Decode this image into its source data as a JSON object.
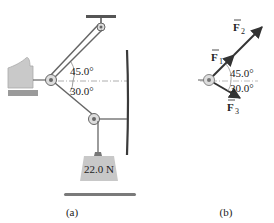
{
  "figure_a": {
    "caption": "(a)",
    "angle_upper": "45.0°",
    "angle_lower": "30.0°",
    "weight_label": "22.0 N"
  },
  "figure_b": {
    "caption": "(b)",
    "angle_upper": "45.0°",
    "angle_lower": "30.0°",
    "force_1": "F",
    "force_1_sub": "1",
    "force_2": "F",
    "force_2_sub": "2",
    "force_3": "F",
    "force_3_sub": "3"
  },
  "colors": {
    "hand": "#c9c9c9",
    "weight": "#c8c8c8",
    "wall": "#3a3a3a",
    "cable": "#555555",
    "dashed": "#999999"
  }
}
